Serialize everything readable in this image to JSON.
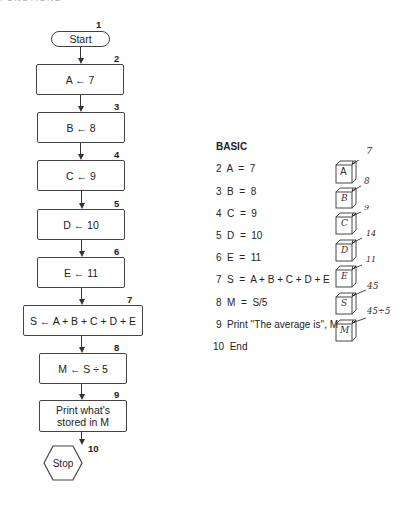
{
  "header": {
    "text": "FUNCTIONS"
  },
  "flowchart": {
    "start": {
      "label": "Start",
      "step": "1"
    },
    "steps": [
      {
        "step": "2",
        "label": "A ← 7"
      },
      {
        "step": "3",
        "label": "B ← 8"
      },
      {
        "step": "4",
        "label": "C ← 9"
      },
      {
        "step": "5",
        "label": "D ← 10"
      },
      {
        "step": "6",
        "label": "E ← 11"
      },
      {
        "step": "7",
        "label": "S ← A + B + C + D + E"
      },
      {
        "step": "8",
        "label": "M ← S ÷ 5"
      },
      {
        "step": "9",
        "label": "Print what's stored in M"
      }
    ],
    "stop": {
      "label": "Stop",
      "step": "10"
    }
  },
  "basic": {
    "title": "BASIC",
    "lines": [
      "2  A  =  7",
      "3  B  =  8",
      "4  C  =  9",
      "5  D  =  10",
      "6  E  =  11",
      "7  S  =  A + B + C + D + E",
      "8  M  =  S/5",
      "9  Print ''The average is'', M",
      "10  End"
    ]
  },
  "memory_boxes": [
    {
      "name": "A",
      "value": "7"
    },
    {
      "name": "B",
      "value": "8"
    },
    {
      "name": "C",
      "value": "9"
    },
    {
      "name": "D",
      "value": "14"
    },
    {
      "name": "E",
      "value": "11"
    },
    {
      "name": "S",
      "value": "45"
    },
    {
      "name": "M",
      "value": "45÷5"
    }
  ]
}
